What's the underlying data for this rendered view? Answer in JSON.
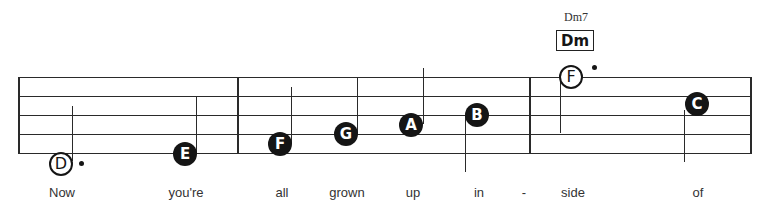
{
  "chord": {
    "name": "Dm7",
    "box_label": "Dm"
  },
  "notes": [
    {
      "letter": "D",
      "style": "open",
      "dotted": true,
      "lyric": "Now"
    },
    {
      "letter": "E",
      "style": "filled",
      "dotted": false,
      "lyric": "you're"
    },
    {
      "letter": "F",
      "style": "filled",
      "dotted": false,
      "lyric": "all"
    },
    {
      "letter": "G",
      "style": "filled",
      "dotted": false,
      "lyric": "grown"
    },
    {
      "letter": "A",
      "style": "filled",
      "dotted": false,
      "lyric": "up"
    },
    {
      "letter": "B",
      "style": "filled",
      "dotted": false,
      "lyric": "in"
    },
    {
      "letter": "F",
      "style": "open",
      "dotted": true,
      "lyric": "side"
    },
    {
      "letter": "C",
      "style": "filled",
      "dotted": false,
      "lyric": "of"
    }
  ],
  "lyrics": [
    "Now",
    "you're",
    "all",
    "grown",
    "up",
    "in",
    "-",
    "side",
    "of"
  ]
}
